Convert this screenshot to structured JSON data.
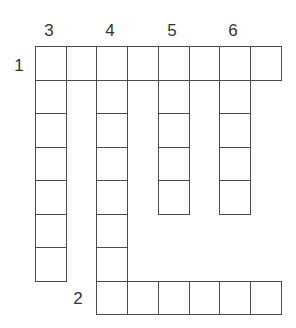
{
  "puzzle": {
    "origin": {
      "x": 35,
      "y": 46
    },
    "cell_w": 30.7,
    "cell_h": 33.5,
    "line_color": "#4a4a4a",
    "words": [
      {
        "number": "1",
        "direction": "across",
        "row": 0,
        "col": 0,
        "length": 8,
        "label_pos": {
          "x": 19,
          "y": 65
        }
      },
      {
        "number": "2",
        "direction": "across",
        "row": 7,
        "col": 2,
        "length": 6,
        "label_pos": {
          "x": 78,
          "y": 298
        }
      },
      {
        "number": "3",
        "direction": "down",
        "row": 0,
        "col": 0,
        "length": 7,
        "label_pos": {
          "x": 49,
          "y": 30
        }
      },
      {
        "number": "4",
        "direction": "down",
        "row": 0,
        "col": 2,
        "length": 8,
        "label_pos": {
          "x": 110,
          "y": 30
        }
      },
      {
        "number": "5",
        "direction": "down",
        "row": 0,
        "col": 4,
        "length": 5,
        "label_pos": {
          "x": 172,
          "y": 30
        }
      },
      {
        "number": "6",
        "direction": "down",
        "row": 0,
        "col": 6,
        "length": 5,
        "label_pos": {
          "x": 233,
          "y": 30
        }
      }
    ]
  }
}
